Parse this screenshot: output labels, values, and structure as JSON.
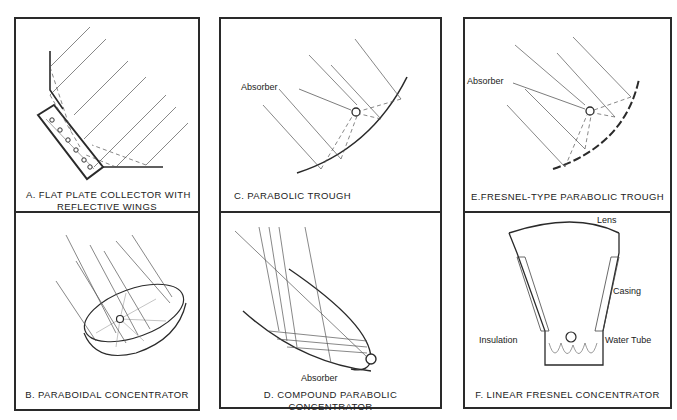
{
  "figure": {
    "panels": [
      {
        "id": "A",
        "caption_line1": "A.   FLAT PLATE COLLECTOR WITH",
        "caption_line2": "REFLECTIVE WINGS",
        "labels": []
      },
      {
        "id": "B",
        "caption": "B.   PARABOIDAL CONCENTRATOR",
        "labels": []
      },
      {
        "id": "C",
        "caption": "C.   PARABOLIC  TROUGH",
        "labels": [
          "Absorber"
        ]
      },
      {
        "id": "D",
        "caption": "D. COMPOUND  PARABOLIC  CONCENTRATOR",
        "labels": [
          "Absorber"
        ]
      },
      {
        "id": "E",
        "caption": "E.FRESNEL-TYPE  PARABOLIC  TROUGH",
        "labels": [
          "Absorber"
        ]
      },
      {
        "id": "F",
        "caption": "F.   LINEAR  FRESNEL  CONCENTRATOR",
        "labels": [
          "Lens",
          "Casing",
          "Insulation",
          "Water  Tube"
        ]
      }
    ]
  },
  "colors": {
    "line": "#2a2a2a",
    "ray": "#555555",
    "background": "#ffffff"
  }
}
